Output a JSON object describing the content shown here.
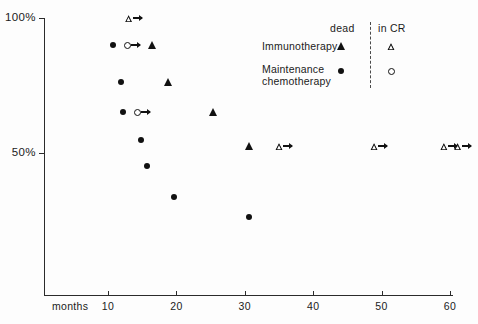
{
  "chart_data": {
    "type": "scatter",
    "title": "",
    "xlabel": "months",
    "ylabel": "",
    "xlim": [
      0,
      62
    ],
    "ylim": [
      20,
      102
    ],
    "grid": false,
    "x_ticks": [
      {
        "value": 10,
        "label": "10"
      },
      {
        "value": 20,
        "label": "20"
      },
      {
        "value": 30,
        "label": "30"
      },
      {
        "value": 40,
        "label": "40"
      },
      {
        "value": 50,
        "label": "50"
      },
      {
        "value": 60,
        "label": "60"
      }
    ],
    "y_ticks": [
      {
        "value": 100,
        "label": "100%"
      },
      {
        "value": 50,
        "label": "50%"
      }
    ],
    "legend": {
      "position": "top-right",
      "column_headers": [
        "dead",
        "in CR"
      ],
      "rows": [
        {
          "label": "Immunotherapy",
          "dead_marker": "filled-triangle",
          "incr_marker": "open-triangle"
        },
        {
          "label": "Maintenance chemotherapy",
          "dead_marker": "filled-circle",
          "incr_marker": "open-circle"
        }
      ]
    },
    "series": [
      {
        "name": "Immunotherapy dead",
        "marker": "filled-triangle",
        "censored": false,
        "points": [
          {
            "x": 16.4,
            "y": 90.0
          },
          {
            "x": 18.7,
            "y": 76.3
          },
          {
            "x": 25.3,
            "y": 65.2
          },
          {
            "x": 30.6,
            "y": 52.6
          }
        ]
      },
      {
        "name": "Immunotherapy in CR",
        "marker": "open-triangle",
        "censored": true,
        "points": [
          {
            "x": 13.0,
            "y": 100.0
          },
          {
            "x": 35.0,
            "y": 52.6
          },
          {
            "x": 48.9,
            "y": 52.6
          },
          {
            "x": 59.1,
            "y": 52.6
          },
          {
            "x": 61.1,
            "y": 52.6
          }
        ]
      },
      {
        "name": "Maintenance chemotherapy dead",
        "marker": "filled-circle",
        "censored": false,
        "points": [
          {
            "x": 10.7,
            "y": 90.0
          },
          {
            "x": 11.9,
            "y": 76.3
          },
          {
            "x": 12.2,
            "y": 65.2
          },
          {
            "x": 14.8,
            "y": 54.8
          },
          {
            "x": 15.7,
            "y": 45.2
          },
          {
            "x": 19.7,
            "y": 33.7
          },
          {
            "x": 30.6,
            "y": 26.3
          }
        ]
      },
      {
        "name": "Maintenance chemotherapy in CR",
        "marker": "open-circle",
        "censored": true,
        "points": [
          {
            "x": 12.8,
            "y": 90.0
          },
          {
            "x": 14.3,
            "y": 65.2
          }
        ]
      }
    ]
  },
  "axes": {
    "x_title": "months",
    "y_top_label": "100%",
    "y_bottom_label": "50%",
    "x_tick_labels": [
      "10",
      "20",
      "30",
      "40",
      "50",
      "60"
    ]
  },
  "legend": {
    "header_dead": "dead",
    "header_in_cr": "in CR",
    "row_immunotherapy": "Immunotherapy",
    "row_maintenance_line1": "Maintenance",
    "row_maintenance_line2": "chemotherapy"
  },
  "colors": {
    "ink": "#111111",
    "axis": "#2b2b2b",
    "background": "#fdfdfd"
  }
}
